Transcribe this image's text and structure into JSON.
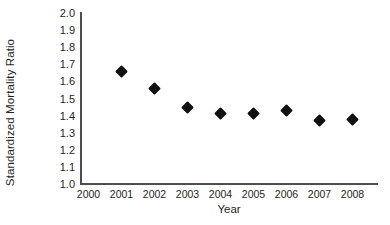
{
  "chart_data": {
    "type": "scatter",
    "title": "",
    "xlabel": "Year",
    "ylabel": "Standardized Mortality Ratio",
    "x": [
      2000,
      2001,
      2002,
      2003,
      2004,
      2005,
      2006,
      2007,
      2008
    ],
    "categories": [
      "2000",
      "2001",
      "2002",
      "2003",
      "2004",
      "2005",
      "2006",
      "2007",
      "2008"
    ],
    "values": [
      null,
      1.66,
      1.56,
      1.45,
      1.41,
      1.41,
      1.43,
      1.37,
      1.38
    ],
    "series": [
      {
        "name": "Standardized Mortality Ratio",
        "marker": "diamond",
        "color": "#111111",
        "points": [
          {
            "x": "2001",
            "y": 1.66
          },
          {
            "x": "2002",
            "y": 1.56
          },
          {
            "x": "2003",
            "y": 1.45
          },
          {
            "x": "2004",
            "y": 1.41
          },
          {
            "x": "2005",
            "y": 1.41
          },
          {
            "x": "2006",
            "y": 1.43
          },
          {
            "x": "2007",
            "y": 1.37
          },
          {
            "x": "2008",
            "y": 1.38
          }
        ]
      }
    ],
    "ylim": [
      1.0,
      2.0
    ],
    "ytick_step": 0.1,
    "yticks": [
      "2.0",
      "1.9",
      "1.8",
      "1.7",
      "1.6",
      "1.5",
      "1.4",
      "1.3",
      "1.2",
      "1.1",
      "1.0"
    ],
    "xticks": [
      "2000",
      "2001",
      "2002",
      "2003",
      "2004",
      "2005",
      "2006",
      "2007",
      "2008"
    ],
    "grid": false,
    "legend": false,
    "axis_color": "#4f4c4d",
    "background": "#ffffff"
  },
  "axes": {
    "y_title": "Standardized Mortality Ratio",
    "x_title": "Year"
  }
}
